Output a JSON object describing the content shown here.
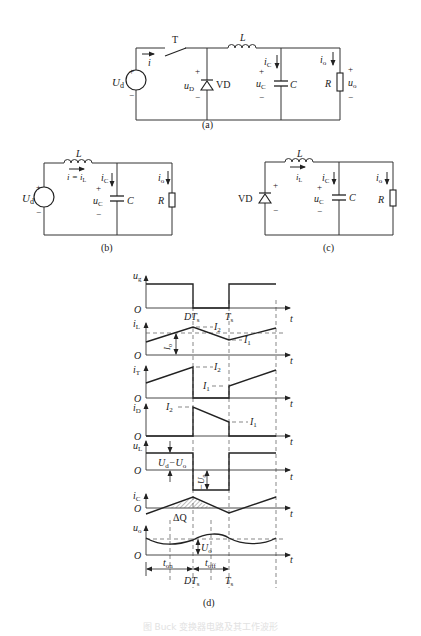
{
  "figure": {
    "caption": "图 Buck 变换器电路及其工作波形",
    "panels": {
      "a": {
        "label": "(a)",
        "source": "U",
        "source_sub": "d",
        "switch": "T",
        "current_i": "i",
        "inductor": "L",
        "diode": "VD",
        "diode_voltage": "u",
        "diode_voltage_sub": "D",
        "cap_current": "i",
        "cap_current_sub": "C",
        "cap_voltage": "u",
        "cap_voltage_sub": "C",
        "capacitor": "C",
        "out_current": "i",
        "out_current_sub": "o",
        "resistor": "R",
        "out_voltage": "u",
        "out_voltage_sub": "o",
        "plus": "+",
        "minus": "−"
      },
      "b": {
        "label": "(b)",
        "source": "U",
        "source_sub": "d",
        "inductor": "L",
        "current": "i = i",
        "current_sub": "L",
        "cap_current": "i",
        "cap_current_sub": "C",
        "cap_voltage": "u",
        "cap_voltage_sub": "C",
        "capacitor": "C",
        "out_current": "i",
        "out_current_sub": "o",
        "resistor": "R",
        "plus": "+",
        "minus": "−"
      },
      "c": {
        "label": "(c)",
        "diode": "VD",
        "inductor": "L",
        "current": "i",
        "current_sub": "L",
        "cap_current": "i",
        "cap_current_sub": "C",
        "cap_voltage": "u",
        "cap_voltage_sub": "C",
        "capacitor": "C",
        "out_current": "i",
        "out_current_sub": "o",
        "resistor": "R",
        "plus": "+",
        "minus": "−"
      },
      "d": {
        "label": "(d)",
        "origin": "O",
        "t": "t",
        "waveforms": {
          "ug": {
            "sym": "u",
            "sub": "g"
          },
          "iL": {
            "sym": "i",
            "sub": "L"
          },
          "iT": {
            "sym": "i",
            "sub": "T"
          },
          "iD": {
            "sym": "i",
            "sub": "D"
          },
          "uL": {
            "sym": "u",
            "sub": "L"
          },
          "iC": {
            "sym": "i",
            "sub": "C"
          },
          "uo": {
            "sym": "u",
            "sub": "o"
          }
        },
        "marks": {
          "DTs": "DT",
          "DTs_sub": "s",
          "Ts": "T",
          "Ts_sub": "s",
          "I2": "I",
          "I2_sub": "2",
          "I1": "I",
          "I1_sub": "1",
          "Io": "I",
          "Io_sub": "o",
          "Ud_minus_Uo": "U",
          "Ud_minus_Uo_sub1": "d",
          "Ud_minus_Uo_mid": "−U",
          "Ud_minus_Uo_sub2": "o",
          "neg_Uo": "−U",
          "neg_Uo_sub": "o",
          "dQ": "ΔQ",
          "Uo": "U",
          "Uo_sub": "o",
          "ton": "t",
          "ton_sub": "on",
          "toff": "t",
          "toff_sub": "off"
        }
      }
    }
  }
}
